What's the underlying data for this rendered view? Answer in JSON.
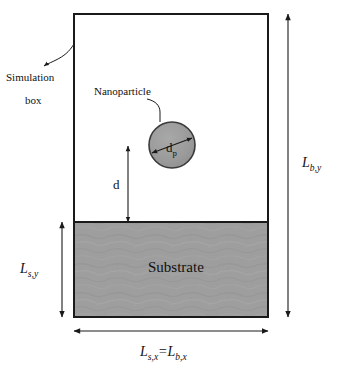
{
  "figure": {
    "type": "schematic-diagram",
    "colors": {
      "background": "#ffffff",
      "substrate_fill": "#9e9e9e",
      "particle_fill": "#9a9a9a",
      "line": "#1a1a1a",
      "text": "#111111"
    },
    "geometry": {
      "box": {
        "x": 74,
        "y": 14,
        "width": 194,
        "height": 303
      },
      "substrate": {
        "x": 74,
        "y": 222,
        "width": 194,
        "height": 95
      },
      "particle": {
        "cx": 172,
        "cy": 145,
        "r": 23
      },
      "d_line": {
        "x": 128,
        "y_top": 146,
        "y_bottom": 222
      },
      "lby_line": {
        "x": 288,
        "y_top": 14,
        "y_bottom": 317
      },
      "lsy_line": {
        "x": 62,
        "y_top": 222,
        "y_bottom": 317
      },
      "lsx_line": {
        "y": 331,
        "x_left": 74,
        "x_right": 268
      }
    }
  },
  "labels": {
    "simulation_box_line1": "Simulation",
    "simulation_box_line2": "box",
    "nanoparticle": "Nanoparticle",
    "substrate": "Substrate",
    "particle_diameter": {
      "base": "d",
      "sub": "p"
    },
    "gap_distance": "d",
    "box_height": {
      "base": "L",
      "sub": "b,y"
    },
    "substrate_height": {
      "base": "L",
      "sub": "s,y"
    },
    "width_equality": {
      "base1": "L",
      "sub1": "s,x",
      "equals": "=",
      "base2": "L",
      "sub2": "b,x"
    }
  }
}
